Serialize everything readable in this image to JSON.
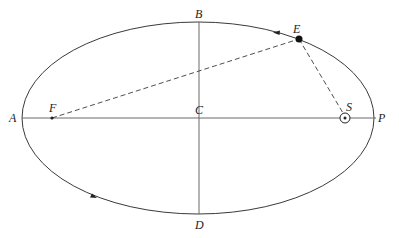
{
  "diagram": {
    "type": "elliptical-orbit",
    "colors": {
      "line": "#3a3a3a",
      "axis": "#6a6a6a",
      "text": "#222222",
      "background": "#ffffff"
    },
    "ellipse": {
      "cx": 198,
      "cy": 118,
      "rx": 176,
      "ry": 96
    },
    "points": {
      "A": {
        "label": "A",
        "x": 22,
        "y": 118
      },
      "B": {
        "label": "B",
        "x": 199,
        "y": 22
      },
      "C": {
        "label": "C",
        "x": 199,
        "y": 118
      },
      "D": {
        "label": "D",
        "x": 199,
        "y": 214
      },
      "E": {
        "label": "E",
        "x": 299,
        "y": 39
      },
      "F": {
        "label": "F",
        "x": 52,
        "y": 118
      },
      "S": {
        "label": "S",
        "x": 345,
        "y": 118
      },
      "P": {
        "label": "P",
        "x": 374,
        "y": 118
      }
    },
    "segments": [
      {
        "from": "F",
        "to": "E",
        "style": "dashed"
      },
      {
        "from": "E",
        "to": "S",
        "style": "dashed"
      },
      {
        "from": "A",
        "to": "P",
        "style": "solid"
      },
      {
        "from": "B",
        "to": "D",
        "style": "solid"
      }
    ],
    "direction_arrows": [
      {
        "x": 278,
        "y": 33,
        "direction": "counterclockwise"
      },
      {
        "x": 93,
        "y": 196,
        "direction": "counterclockwise"
      }
    ],
    "sun_symbol": "circled-dot"
  }
}
